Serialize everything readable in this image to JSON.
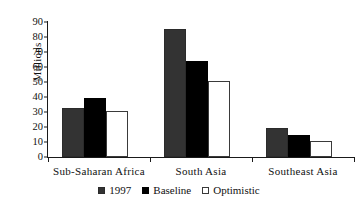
{
  "chart_data": {
    "type": "bar",
    "title": "",
    "subtitle": "",
    "xlabel": "",
    "ylabel": "Millions",
    "ylim": [
      0,
      90
    ],
    "ytick_step": 10,
    "yticks": [
      90,
      80,
      70,
      60,
      50,
      40,
      30,
      20,
      10,
      0
    ],
    "grid": false,
    "legend_position": "bottom-center",
    "categories": [
      "Sub-Saharan Africa",
      "South Asia",
      "Southeast Asia"
    ],
    "series": [
      {
        "name": "1997",
        "color": "#333333",
        "values": [
          33,
          85.5,
          19.5
        ]
      },
      {
        "name": "Baseline",
        "color": "#000000",
        "values": [
          39.5,
          64,
          14.5
        ]
      },
      {
        "name": "Optimistic",
        "color": "#ffffff",
        "values": [
          30.5,
          51,
          11
        ]
      }
    ]
  }
}
